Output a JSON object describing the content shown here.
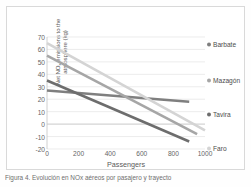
{
  "figure": {
    "caption": "Figura 4. Evolución en NOx aéreos por pasajero y trayecto",
    "background": "#ffffff"
  },
  "chart_data": {
    "type": "line",
    "title": "",
    "subtitle": "",
    "xlabel": "Passengers",
    "ylabel": "Net NOx emissions to the atmosphere (kg)",
    "ylabel_main": "Net NO",
    "ylabel_sub": "x",
    "ylabel_rest": " emissions to the",
    "ylabel_line2": "atmosphere (kg)",
    "xlim": [
      0,
      1000
    ],
    "ylim": [
      -20,
      70
    ],
    "xticks": [
      0,
      200,
      400,
      600,
      800,
      1000
    ],
    "ytick_labels": [
      "70",
      "60",
      "50",
      "40",
      "30",
      "20",
      "10",
      "0",
      "-10",
      "-20"
    ],
    "yticks": [
      70,
      60,
      50,
      40,
      30,
      20,
      10,
      0,
      -10,
      -20
    ],
    "grid": true,
    "grid_axis": "y",
    "grid_color": "#e4e4e4",
    "legend_position": "right",
    "series": [
      {
        "name": "Barbate",
        "color": "#7f7f7f",
        "x": [
          0,
          900
        ],
        "values": [
          27,
          18
        ],
        "legend_y": 37
      },
      {
        "name": "Mazagón",
        "color": "#a6a6a6",
        "x": [
          0,
          950
        ],
        "values": [
          55,
          -8
        ],
        "legend_y": 73
      },
      {
        "name": "Tavira",
        "color": "#6d6d6d",
        "x": [
          0,
          900
        ],
        "values": [
          35,
          -14
        ],
        "legend_y": 107
      },
      {
        "name": "Faro",
        "color": "#d4d4d4",
        "x": [
          0,
          1000
        ],
        "values": [
          65,
          -5
        ],
        "legend_y": 141
      }
    ]
  }
}
